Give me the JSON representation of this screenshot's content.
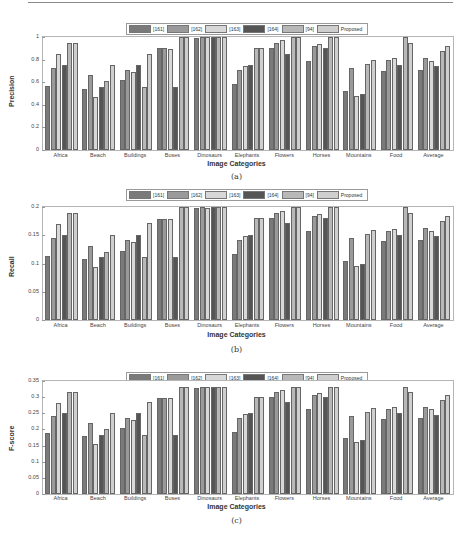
{
  "legend": [
    "[161]",
    "[162]",
    "[163]",
    "[164]",
    "[94]",
    "Proposed"
  ],
  "series_colors": [
    "#7a7a7a",
    "#9a9a9a",
    "#d8d8d8",
    "#555555",
    "#b8b8b8",
    "#cfcfcf"
  ],
  "categories": [
    "Africa",
    "Beach",
    "Buildings",
    "Buses",
    "Dinosaurs",
    "Elephants",
    "Flowers",
    "Horses",
    "Mountains",
    "Food",
    "Average"
  ],
  "xlabel": "Image Categories",
  "chart_data": [
    {
      "type": "bar",
      "caption": "(a)",
      "title": "",
      "xlabel": "Image Categories",
      "ylabel": "Precision",
      "ylim": [
        0,
        1
      ],
      "yticks": [
        "0",
        "0.2",
        "0.4",
        "0.6",
        "0.8",
        "1"
      ],
      "categories": [
        "Africa",
        "Beach",
        "Buildings",
        "Buses",
        "Dinosaurs",
        "Elephants",
        "Flowers",
        "Horses",
        "Mountains",
        "Food",
        "Average"
      ],
      "legend_position": "top",
      "series": [
        {
          "name": "[161]",
          "values": [
            0.57,
            0.54,
            0.62,
            0.9,
            0.99,
            0.58,
            0.9,
            0.79,
            0.52,
            0.7,
            0.71
          ]
        },
        {
          "name": "[162]",
          "values": [
            0.73,
            0.66,
            0.71,
            0.9,
            1.0,
            0.71,
            0.95,
            0.92,
            0.73,
            0.8,
            0.81
          ]
        },
        {
          "name": "[163]",
          "values": [
            0.85,
            0.47,
            0.69,
            0.89,
            1.0,
            0.74,
            0.97,
            0.94,
            0.48,
            0.81,
            0.79
          ]
        },
        {
          "name": "[164]",
          "values": [
            0.75,
            0.56,
            0.75,
            0.56,
            1.0,
            0.75,
            0.85,
            0.9,
            0.5,
            0.75,
            0.74
          ]
        },
        {
          "name": "[94]",
          "values": [
            0.95,
            0.61,
            0.56,
            1.0,
            1.0,
            0.9,
            1.0,
            1.0,
            0.76,
            1.0,
            0.88
          ]
        },
        {
          "name": "Proposed",
          "values": [
            0.95,
            0.75,
            0.85,
            1.0,
            1.0,
            0.9,
            1.0,
            1.0,
            0.8,
            0.95,
            0.92
          ]
        }
      ]
    },
    {
      "type": "bar",
      "caption": "(b)",
      "title": "",
      "xlabel": "Image Categories",
      "ylabel": "Recall",
      "ylim": [
        0,
        0.2
      ],
      "yticks": [
        "0",
        "0.05",
        "0.1",
        "0.15",
        "0.2"
      ],
      "categories": [
        "Africa",
        "Beach",
        "Buildings",
        "Buses",
        "Dinosaurs",
        "Elephants",
        "Flowers",
        "Horses",
        "Mountains",
        "Food",
        "Average"
      ],
      "legend_position": "top",
      "series": [
        {
          "name": "[161]",
          "values": [
            0.113,
            0.108,
            0.123,
            0.179,
            0.198,
            0.116,
            0.18,
            0.157,
            0.104,
            0.14,
            0.142
          ]
        },
        {
          "name": "[162]",
          "values": [
            0.146,
            0.131,
            0.142,
            0.179,
            0.2,
            0.142,
            0.19,
            0.184,
            0.146,
            0.158,
            0.162
          ]
        },
        {
          "name": "[163]",
          "values": [
            0.17,
            0.094,
            0.138,
            0.178,
            0.198,
            0.148,
            0.193,
            0.188,
            0.096,
            0.161,
            0.158
          ]
        },
        {
          "name": "[164]",
          "values": [
            0.15,
            0.111,
            0.151,
            0.111,
            0.2,
            0.15,
            0.171,
            0.18,
            0.1,
            0.15,
            0.148
          ]
        },
        {
          "name": "[94]",
          "values": [
            0.19,
            0.121,
            0.111,
            0.2,
            0.2,
            0.18,
            0.2,
            0.2,
            0.152,
            0.2,
            0.176
          ]
        },
        {
          "name": "Proposed",
          "values": [
            0.19,
            0.151,
            0.171,
            0.2,
            0.2,
            0.18,
            0.2,
            0.2,
            0.16,
            0.19,
            0.184
          ]
        }
      ]
    },
    {
      "type": "bar",
      "caption": "(c)",
      "title": "",
      "xlabel": "Image Categories",
      "ylabel": "F-score",
      "ylim": [
        0,
        0.35
      ],
      "yticks": [
        "0",
        "0.05",
        "0.1",
        "0.15",
        "0.2",
        "0.25",
        "0.3",
        "0.35"
      ],
      "categories": [
        "Africa",
        "Beach",
        "Buildings",
        "Buses",
        "Dinosaurs",
        "Elephants",
        "Flowers",
        "Horses",
        "Mountains",
        "Food",
        "Average"
      ],
      "legend_position": "top",
      "series": [
        {
          "name": "[161]",
          "values": [
            0.188,
            0.18,
            0.205,
            0.298,
            0.329,
            0.193,
            0.3,
            0.262,
            0.173,
            0.232,
            0.235
          ]
        },
        {
          "name": "[162]",
          "values": [
            0.242,
            0.219,
            0.236,
            0.298,
            0.333,
            0.236,
            0.316,
            0.306,
            0.242,
            0.263,
            0.269
          ]
        },
        {
          "name": "[163]",
          "values": [
            0.283,
            0.156,
            0.229,
            0.296,
            0.332,
            0.247,
            0.322,
            0.312,
            0.16,
            0.268,
            0.263
          ]
        },
        {
          "name": "[164]",
          "values": [
            0.25,
            0.184,
            0.25,
            0.184,
            0.333,
            0.25,
            0.284,
            0.3,
            0.167,
            0.25,
            0.245
          ]
        },
        {
          "name": "[94]",
          "values": [
            0.317,
            0.202,
            0.184,
            0.333,
            0.333,
            0.3,
            0.333,
            0.333,
            0.253,
            0.333,
            0.292
          ]
        },
        {
          "name": "Proposed",
          "values": [
            0.317,
            0.251,
            0.284,
            0.333,
            0.333,
            0.3,
            0.333,
            0.333,
            0.267,
            0.317,
            0.307
          ]
        }
      ]
    }
  ]
}
